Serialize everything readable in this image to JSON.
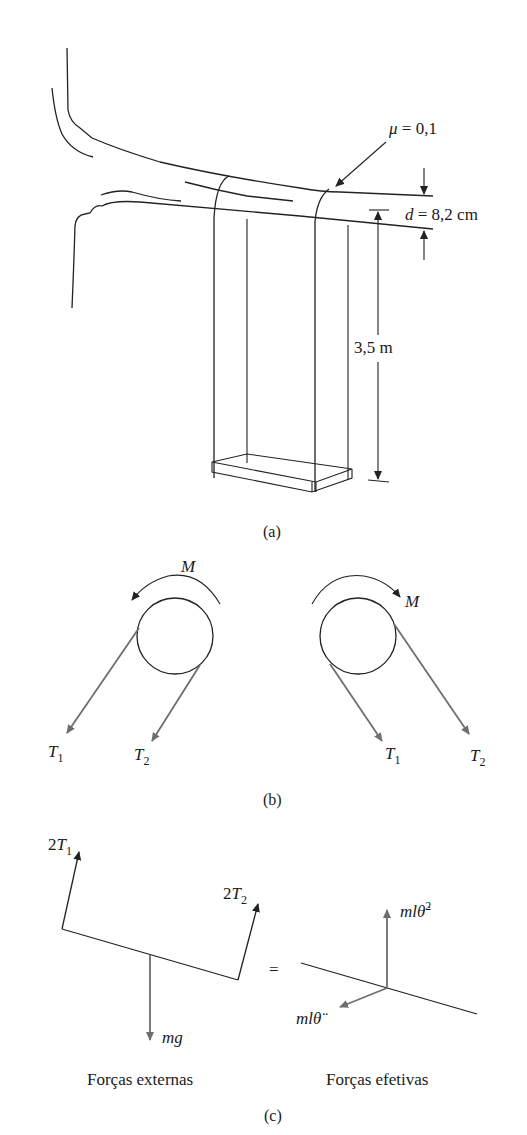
{
  "figure": {
    "panel_a": {
      "caption": "(a)",
      "friction_label": "μ = 0,1",
      "diameter_label_var": "d",
      "diameter_label_val": " = 8,2 cm",
      "length_label": "3,5 m"
    },
    "panel_b": {
      "caption": "(b)",
      "left": {
        "moment": "M",
        "t1": "T",
        "t1_sub": "1",
        "t2": "T",
        "t2_sub": "2"
      },
      "right": {
        "moment": "M",
        "t1": "T",
        "t1_sub": "1",
        "t2": "T",
        "t2_sub": "2"
      }
    },
    "panel_c": {
      "caption": "(c)",
      "external": {
        "title": "Forças externas",
        "f1_coef": "2",
        "f1_var": "T",
        "f1_sub": "1",
        "f2_coef": "2",
        "f2_var": "T",
        "f2_sub": "2",
        "weight": "mg"
      },
      "equals": "=",
      "effective": {
        "title": "Forças efetivas",
        "normal": "mlθ̇",
        "normal_exp": "2",
        "tangential": "mlθ̈"
      }
    },
    "colors": {
      "ink": "#222222",
      "force_arrow": "#6e6e6e",
      "background": "#ffffff"
    }
  }
}
